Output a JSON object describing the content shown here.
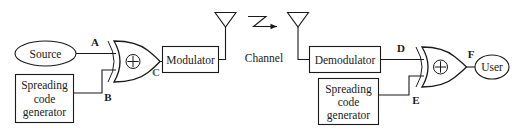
{
  "diagram": {
    "colors": {
      "stroke": "#1a1a1a",
      "background": "#ffffff",
      "node_c_accent": "#2f6f63"
    },
    "transmitter": {
      "source_label": "Source",
      "spreading_generator_line1": "Spreading",
      "spreading_generator_line2": "code",
      "spreading_generator_line3": "generator",
      "modulator_label": "Modulator",
      "xor_symbol": "+",
      "node_a": "A",
      "node_b": "B",
      "node_c": "C"
    },
    "channel": {
      "label": "Channel",
      "propagation_symbol": "z-arrow"
    },
    "receiver": {
      "demodulator_label": "Demodulator",
      "spreading_generator_line1": "Spreading",
      "spreading_generator_line2": "code",
      "spreading_generator_line3": "generator",
      "user_label": "User",
      "xor_symbol": "+",
      "node_d": "D",
      "node_e": "E",
      "node_f": "F"
    }
  }
}
